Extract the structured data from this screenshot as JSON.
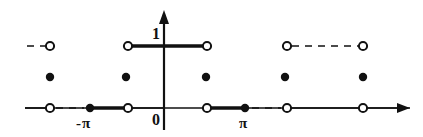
{
  "figure": {
    "background_color": "#ffffff",
    "ink_color": "#111111"
  },
  "axes": {
    "x_axis": {
      "name": "x-axis",
      "y_pixel": 108,
      "x_start": 25,
      "x_end": 410,
      "has_arrow_right": true
    },
    "y_axis": {
      "name": "y-axis",
      "x_pixel": 164,
      "y_top": 10,
      "y_bottom": 130,
      "has_arrow_up": true
    },
    "origin_label": "0",
    "value_label": "1"
  },
  "labels": [
    {
      "name": "label-one",
      "text": "1",
      "x": 152,
      "y": 26
    },
    {
      "name": "label-zero",
      "text": "0",
      "x": 152,
      "y": 112
    },
    {
      "name": "label-neg-pi",
      "text": "−π",
      "x": 76,
      "y": 116
    },
    {
      "name": "label-pi",
      "text": "π",
      "x": 239,
      "y": 116
    }
  ],
  "chart_data": {
    "type": "line",
    "title": "",
    "xlabel": "",
    "ylabel": "",
    "xlim": [
      -3.5,
      3.2
    ],
    "ylim": [
      0,
      1.25
    ],
    "grid": false,
    "legend": null,
    "tick_labels": {
      "x": [
        "-π",
        "0",
        "π"
      ],
      "y": [
        "0",
        "1"
      ]
    },
    "x_tick_pixels": {
      "-pi": 90,
      "0": 164,
      "pi": 245
    },
    "y_level_pixels": {
      "0": 108,
      "1": 46
    },
    "segments": [
      {
        "name": "level-1-left-dashed",
        "level": 1,
        "x_from": 27,
        "x_to": 45,
        "style": "dashed",
        "weight": "thin"
      },
      {
        "name": "level-1-center-solid",
        "level": 1,
        "x_from": 128,
        "x_to": 207,
        "style": "solid",
        "weight": "thick"
      },
      {
        "name": "level-1-right-dashed",
        "level": 1,
        "x_from": 292,
        "x_to": 358,
        "style": "dashed",
        "weight": "thin"
      },
      {
        "name": "level-0-far-left-thin",
        "level": 0,
        "x_from": 25,
        "x_to": 50,
        "style": "solid",
        "weight": "thin"
      },
      {
        "name": "level-0-left-dashed",
        "level": 0,
        "x_from": 56,
        "x_to": 84,
        "style": "dashed",
        "weight": "thin"
      },
      {
        "name": "level-0-left-solid",
        "level": 0,
        "x_from": 90,
        "x_to": 128,
        "style": "solid",
        "weight": "thick"
      },
      {
        "name": "level-0-left-thin",
        "level": 0,
        "x_from": 128,
        "x_to": 164,
        "style": "solid",
        "weight": "thin"
      },
      {
        "name": "level-0-right-solid",
        "level": 0,
        "x_from": 207,
        "x_to": 245,
        "style": "solid",
        "weight": "thick"
      },
      {
        "name": "level-0-right-dashed",
        "level": 0,
        "x_from": 252,
        "x_to": 281,
        "style": "dashed",
        "weight": "thin"
      },
      {
        "name": "level-0-far-right-thin",
        "level": 0,
        "x_from": 287,
        "x_to": 410,
        "style": "solid",
        "weight": "thin"
      }
    ],
    "markers": [
      {
        "name": "open-circle-level1-left-end",
        "kind": "open",
        "x": 50,
        "y": 46,
        "level": 1
      },
      {
        "name": "open-circle-level1-center-left",
        "kind": "open",
        "x": 128,
        "y": 46,
        "level": 1
      },
      {
        "name": "open-circle-level1-center-right",
        "kind": "open",
        "x": 207,
        "y": 46,
        "level": 1
      },
      {
        "name": "open-circle-level1-right-start",
        "kind": "open",
        "x": 287,
        "y": 46,
        "level": 1
      },
      {
        "name": "open-circle-level1-right-end",
        "kind": "open",
        "x": 363,
        "y": 46,
        "level": 1
      },
      {
        "name": "filled-dot-mid-1",
        "kind": "filled",
        "x": 50,
        "y": 77,
        "level": 0.5
      },
      {
        "name": "filled-dot-mid-2",
        "kind": "filled",
        "x": 126,
        "y": 77,
        "level": 0.5
      },
      {
        "name": "filled-dot-mid-3",
        "kind": "filled",
        "x": 206,
        "y": 77,
        "level": 0.5
      },
      {
        "name": "filled-dot-mid-4",
        "kind": "filled",
        "x": 285,
        "y": 77,
        "level": 0.5
      },
      {
        "name": "filled-dot-mid-5",
        "kind": "filled",
        "x": 363,
        "y": 77,
        "level": 0.5
      },
      {
        "name": "open-circle-axis-1",
        "kind": "open",
        "x": 50,
        "y": 108,
        "level": 0
      },
      {
        "name": "filled-dot-axis-neg-pi",
        "kind": "filled",
        "x": 90,
        "y": 108,
        "level": 0
      },
      {
        "name": "open-circle-axis-2",
        "kind": "open",
        "x": 128,
        "y": 108,
        "level": 0
      },
      {
        "name": "open-circle-axis-3",
        "kind": "open",
        "x": 207,
        "y": 108,
        "level": 0
      },
      {
        "name": "filled-dot-axis-pi",
        "kind": "filled",
        "x": 245,
        "y": 108,
        "level": 0
      },
      {
        "name": "open-circle-axis-4",
        "kind": "open",
        "x": 287,
        "y": 108,
        "level": 0
      },
      {
        "name": "open-circle-axis-5",
        "kind": "open",
        "x": 363,
        "y": 108,
        "level": 0
      }
    ]
  }
}
